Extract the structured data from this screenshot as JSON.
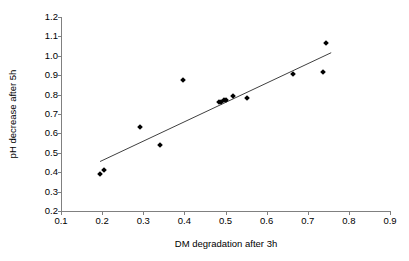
{
  "chart_data": {
    "type": "scatter",
    "title": "",
    "xlabel": "DM degradation after 3h",
    "ylabel": "pH decrease after 5h",
    "xlim": [
      0.1,
      0.9
    ],
    "ylim": [
      0.2,
      1.2
    ],
    "xticks": [
      "0.1",
      "0.2",
      "0.3",
      "0.4",
      "0.5",
      "0.6",
      "0.7",
      "0.8",
      "0.9"
    ],
    "xtick_values": [
      0.1,
      0.2,
      0.3,
      0.4,
      0.5,
      0.6,
      0.7,
      0.8,
      0.9
    ],
    "yticks": [
      "0.2",
      "0.3",
      "0.4",
      "0.5",
      "0.6",
      "0.7",
      "0.8",
      "0.9",
      "1.0",
      "1.1",
      "1.2"
    ],
    "ytick_values": [
      0.2,
      0.3,
      0.4,
      0.5,
      0.6,
      0.7,
      0.8,
      0.9,
      1.0,
      1.1,
      1.2
    ],
    "grid": false,
    "legend": false,
    "marker": "diamond",
    "marker_color": "#000000",
    "axis_color": "#808080",
    "points": [
      {
        "x": 0.196,
        "y": 0.392
      },
      {
        "x": 0.205,
        "y": 0.409
      },
      {
        "x": 0.291,
        "y": 0.631
      },
      {
        "x": 0.34,
        "y": 0.542
      },
      {
        "x": 0.396,
        "y": 0.873
      },
      {
        "x": 0.483,
        "y": 0.76
      },
      {
        "x": 0.489,
        "y": 0.762
      },
      {
        "x": 0.497,
        "y": 0.774
      },
      {
        "x": 0.501,
        "y": 0.772
      },
      {
        "x": 0.518,
        "y": 0.793
      },
      {
        "x": 0.553,
        "y": 0.783
      },
      {
        "x": 0.664,
        "y": 0.908
      },
      {
        "x": 0.738,
        "y": 0.919
      },
      {
        "x": 0.745,
        "y": 1.067
      }
    ],
    "trendline": {
      "type": "linear",
      "x_start": 0.195,
      "y_start": 0.455,
      "x_end": 0.757,
      "y_end": 1.016,
      "color": "#404040"
    }
  }
}
